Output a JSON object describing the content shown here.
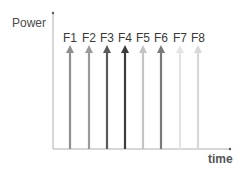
{
  "diagram": {
    "y_axis_label": "Power",
    "x_axis_label": "time",
    "axis_color": "#9a9a9a",
    "arrows": [
      {
        "label": "F1",
        "x": 70,
        "color": "#8f8f8f"
      },
      {
        "label": "F2",
        "x": 89,
        "color": "#9a9a9a"
      },
      {
        "label": "F3",
        "x": 107,
        "color": "#5a5a5a"
      },
      {
        "label": "F4",
        "x": 125,
        "color": "#3c3c3c"
      },
      {
        "label": "F5",
        "x": 143,
        "color": "#c4c4c4"
      },
      {
        "label": "F6",
        "x": 161,
        "color": "#7a7a7a"
      },
      {
        "label": "F7",
        "x": 180,
        "color": "#e4e4e4"
      },
      {
        "label": "F8",
        "x": 198,
        "color": "#d8d8d8"
      }
    ]
  }
}
